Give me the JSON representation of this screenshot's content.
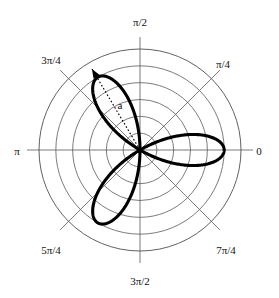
{
  "figure": {
    "kind": "polar-plot",
    "background_color": "#ffffff",
    "grid_color": "#59595c",
    "curve_color": "#000000",
    "label_color": "#111111",
    "center": {
      "x": 140,
      "y": 150
    },
    "outer_radius": 101
  },
  "chart_data": {
    "type": "line",
    "coordinate_system": "polar",
    "title": "",
    "subtitle": "",
    "xlabel": "",
    "ylabel": "",
    "grid": true,
    "legend_position": "none",
    "equation": "r = a cos(3θ)",
    "petal_count": 3,
    "amplitude_a": 1.0,
    "rlim": [
      0,
      1.2
    ],
    "radial_gridline_count": 6,
    "radial_gridline_values": [
      0.2,
      0.4,
      0.6,
      0.8,
      1.0,
      1.2
    ],
    "theta_range_rad": [
      0,
      6.283185307179586
    ],
    "petal_peak_angles_rad": [
      0.0,
      2.0943951023931953,
      4.1887902047863905
    ],
    "petal_peak_angles_label": [
      "0",
      "2π/3",
      "4π/3"
    ],
    "petal_peak_radius": 1.0,
    "theta_tick_values_rad": [
      0,
      0.7853981633974483,
      1.5707963267948966,
      2.356194490192345,
      3.141592653589793,
      3.9269908169872414,
      4.71238898038469,
      5.497787143782138
    ],
    "theta_tick_labels": [
      "0",
      "π/4",
      "π/2",
      "3π/4",
      "π",
      "5π/4",
      "3π/2",
      "7π/4"
    ],
    "sample_points": [
      {
        "theta": 0.0,
        "r": 1.0
      },
      {
        "theta": 0.2618,
        "r": 0.7071
      },
      {
        "theta": 0.5236,
        "r": 0.0
      },
      {
        "theta": 1.5708,
        "r": 0.0
      },
      {
        "theta": 1.8326,
        "r": 0.7071
      },
      {
        "theta": 2.0944,
        "r": 1.0
      },
      {
        "theta": 2.3562,
        "r": 0.7071
      },
      {
        "theta": 2.618,
        "r": 0.0
      },
      {
        "theta": 3.6652,
        "r": 0.0
      },
      {
        "theta": 3.927,
        "r": 0.7071
      },
      {
        "theta": 4.1888,
        "r": 1.0
      },
      {
        "theta": 4.4506,
        "r": 0.7071
      },
      {
        "theta": 4.7124,
        "r": 0.0
      }
    ]
  },
  "theta_labels": [
    {
      "id": "theta-0",
      "text": "0",
      "x": 259,
      "y": 151,
      "anchor": "middle"
    },
    {
      "id": "theta-pi-4",
      "text": "π/4",
      "x": 223,
      "y": 64,
      "anchor": "middle"
    },
    {
      "id": "theta-pi-2",
      "text": "π/2",
      "x": 140,
      "y": 22,
      "anchor": "middle"
    },
    {
      "id": "theta-3pi-4",
      "text": "3π/4",
      "x": 51,
      "y": 60,
      "anchor": "middle"
    },
    {
      "id": "theta-pi",
      "text": "π",
      "x": 17,
      "y": 151,
      "anchor": "middle"
    },
    {
      "id": "theta-5pi-4",
      "text": "5π/4",
      "x": 51,
      "y": 250,
      "anchor": "middle"
    },
    {
      "id": "theta-3pi-2",
      "text": "3π/2",
      "x": 140,
      "y": 281,
      "anchor": "middle"
    },
    {
      "id": "theta-7pi-4",
      "text": "7π/4",
      "x": 226,
      "y": 250,
      "anchor": "middle"
    }
  ],
  "annotation": {
    "label": "a",
    "label_x": 120,
    "label_y": 105,
    "arrow_from": {
      "x": 140,
      "y": 150
    },
    "arrow_to": {
      "x": 92,
      "y": 69
    },
    "style": "dotted-arrow",
    "meaning": "amplitude a = petal length"
  }
}
